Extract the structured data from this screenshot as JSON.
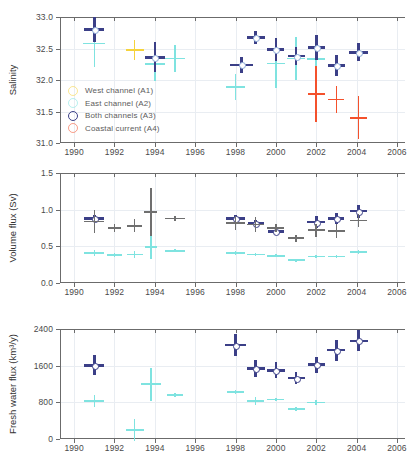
{
  "figure": {
    "width": 420,
    "height": 461,
    "background": "#ffffff"
  },
  "colors": {
    "west_channel": "#f5d33c",
    "east_channel": "#7fe3e0",
    "both_channels": "#3b3f87",
    "coastal_current": "#f4512c",
    "grey_series": "#6f6f6f",
    "axis": "#6b6b6b",
    "grid": "#e9edf2",
    "text": "#4a4a4a"
  },
  "legend": {
    "position": "top-panel-lower-left",
    "items": [
      {
        "label": "West channel (A1)",
        "color_key": "west_channel",
        "marker": "open-circle"
      },
      {
        "label": "East channel (A2)",
        "color_key": "east_channel",
        "marker": "open-circle"
      },
      {
        "label": "Both channels (A3)",
        "color_key": "both_channels",
        "marker": "open-circle"
      },
      {
        "label": "Coastal current (A4)",
        "color_key": "coastal_current",
        "marker": "open-circle"
      }
    ]
  },
  "xaxis": {
    "label": "",
    "min": 1989.3,
    "max": 2006.4,
    "ticks": [
      1990,
      1992,
      1994,
      1996,
      1998,
      2000,
      2002,
      2004,
      2006
    ],
    "ticklabels": [
      "1990",
      "1992",
      "1994",
      "1996",
      "1998",
      "2000",
      "2002",
      "2004",
      "2006"
    ],
    "grid": true
  },
  "chart_data": [
    {
      "type": "scatter",
      "panel": 1,
      "title": "",
      "xlabel": "",
      "ylabel": "Salinity",
      "ylim": [
        31.0,
        33.0
      ],
      "yticks": [
        31.0,
        31.5,
        32.0,
        32.5,
        33.0
      ],
      "yticklabels": [
        "31.0",
        "31.5",
        "32.0",
        "32.5",
        "33.0"
      ],
      "grid": true,
      "legend_position": "lower left",
      "series": [
        {
          "name": "West channel (A1)",
          "color_key": "west_channel",
          "marker": "cross-errorbar",
          "points": [
            {
              "x": 1993.0,
              "y": 32.48,
              "xerr": 0.45,
              "yerr": 0.16
            }
          ]
        },
        {
          "name": "East channel (A2)",
          "color_key": "east_channel",
          "marker": "cross-errorbar",
          "points": [
            {
              "x": 1991.0,
              "y": 32.58,
              "xerr": 0.55,
              "yerr": 0.37
            },
            {
              "x": 1994.0,
              "y": 32.25,
              "xerr": 0.5,
              "yerr": 0.26
            },
            {
              "x": 1995.0,
              "y": 32.34,
              "xerr": 0.5,
              "yerr": 0.21
            },
            {
              "x": 1998.0,
              "y": 31.89,
              "xerr": 0.45,
              "yerr": 0.21
            },
            {
              "x": 1999.0,
              "y": 32.67,
              "xerr": 0.45,
              "yerr": 0.1
            },
            {
              "x": 2000.0,
              "y": 32.26,
              "xerr": 0.45,
              "yerr": 0.38
            },
            {
              "x": 2001.0,
              "y": 32.34,
              "xerr": 0.45,
              "yerr": 0.34
            },
            {
              "x": 2002.0,
              "y": 32.33,
              "xerr": 0.45,
              "yerr": 0.34
            }
          ]
        },
        {
          "name": "Both channels (A3)",
          "color_key": "both_channels",
          "marker": "cross-errorbar-open-circle",
          "points": [
            {
              "x": 1991.0,
              "y": 32.8,
              "xerr": 0.5,
              "yerr": 0.2
            },
            {
              "x": 1994.0,
              "y": 32.36,
              "xerr": 0.5,
              "yerr": 0.24
            },
            {
              "x": 1998.3,
              "y": 32.24,
              "xerr": 0.55,
              "yerr": 0.13
            },
            {
              "x": 1999.0,
              "y": 32.67,
              "xerr": 0.45,
              "yerr": 0.1
            },
            {
              "x": 2000.0,
              "y": 32.48,
              "xerr": 0.42,
              "yerr": 0.18
            },
            {
              "x": 2001.0,
              "y": 32.38,
              "xerr": 0.42,
              "yerr": 0.14
            },
            {
              "x": 2002.0,
              "y": 32.52,
              "xerr": 0.42,
              "yerr": 0.2
            },
            {
              "x": 2003.0,
              "y": 32.23,
              "xerr": 0.42,
              "yerr": 0.17
            },
            {
              "x": 2004.1,
              "y": 32.44,
              "xerr": 0.48,
              "yerr": 0.14
            }
          ]
        },
        {
          "name": "Coastal current (A4)",
          "color_key": "coastal_current",
          "marker": "cross-errorbar",
          "points": [
            {
              "x": 2002.0,
              "y": 31.78,
              "xerr": 0.42,
              "yerr": 0.44
            },
            {
              "x": 2003.0,
              "y": 31.69,
              "xerr": 0.4,
              "yerr": 0.21
            },
            {
              "x": 2004.1,
              "y": 31.4,
              "xerr": 0.42,
              "yerr": 0.34
            }
          ]
        }
      ]
    },
    {
      "type": "scatter",
      "panel": 2,
      "title": "",
      "xlabel": "",
      "ylabel": "Volume flux (Sv)",
      "ylim": [
        0.0,
        1.5
      ],
      "yticks": [
        0.0,
        0.5,
        1.0,
        1.5
      ],
      "yticklabels": [
        "0.0",
        "0.5",
        "1.0",
        "1.5"
      ],
      "grid": true,
      "series": [
        {
          "name": "East channel (A2)",
          "color_key": "east_channel",
          "marker": "cross-errorbar",
          "points": [
            {
              "x": 1991.0,
              "y": 0.41,
              "xerr": 0.5,
              "yerr": 0.04
            },
            {
              "x": 1992.0,
              "y": 0.38,
              "xerr": 0.35,
              "yerr": 0.03
            },
            {
              "x": 1993.0,
              "y": 0.39,
              "xerr": 0.4,
              "yerr": 0.05
            },
            {
              "x": 1993.8,
              "y": 0.49,
              "xerr": 0.3,
              "yerr": 0.16
            },
            {
              "x": 1995.0,
              "y": 0.44,
              "xerr": 0.5,
              "yerr": 0.02
            },
            {
              "x": 1998.0,
              "y": 0.41,
              "xerr": 0.45,
              "yerr": 0.03
            },
            {
              "x": 1999.0,
              "y": 0.39,
              "xerr": 0.45,
              "yerr": 0.02
            },
            {
              "x": 2000.0,
              "y": 0.37,
              "xerr": 0.45,
              "yerr": 0.02
            },
            {
              "x": 2001.0,
              "y": 0.31,
              "xerr": 0.42,
              "yerr": 0.02
            },
            {
              "x": 2002.0,
              "y": 0.36,
              "xerr": 0.42,
              "yerr": 0.02
            },
            {
              "x": 2003.0,
              "y": 0.36,
              "xerr": 0.42,
              "yerr": 0.02
            },
            {
              "x": 2004.1,
              "y": 0.42,
              "xerr": 0.42,
              "yerr": 0.03
            }
          ]
        },
        {
          "name": "Both channels (A3)",
          "color_key": "both_channels",
          "marker": "cross-errorbar-open-circle",
          "points": [
            {
              "x": 1991.0,
              "y": 0.88,
              "xerr": 0.5,
              "yerr": 0.05
            },
            {
              "x": 1998.0,
              "y": 0.88,
              "xerr": 0.45,
              "yerr": 0.05
            },
            {
              "x": 1999.0,
              "y": 0.81,
              "xerr": 0.4,
              "yerr": 0.05
            },
            {
              "x": 2000.0,
              "y": 0.7,
              "xerr": 0.4,
              "yerr": 0.05
            },
            {
              "x": 2002.0,
              "y": 0.83,
              "xerr": 0.45,
              "yerr": 0.08
            },
            {
              "x": 2003.0,
              "y": 0.88,
              "xerr": 0.4,
              "yerr": 0.08
            },
            {
              "x": 2004.1,
              "y": 0.98,
              "xerr": 0.42,
              "yerr": 0.09
            }
          ]
        },
        {
          "name": "Combined estimate",
          "color_key": "grey_series",
          "marker": "cross-errorbar",
          "points": [
            {
              "x": 1991.0,
              "y": 0.84,
              "xerr": 0.5,
              "yerr": 0.16
            },
            {
              "x": 1992.0,
              "y": 0.75,
              "xerr": 0.3,
              "yerr": 0.06
            },
            {
              "x": 1993.0,
              "y": 0.78,
              "xerr": 0.38,
              "yerr": 0.09
            },
            {
              "x": 1993.8,
              "y": 0.97,
              "xerr": 0.33,
              "yerr": 0.33
            },
            {
              "x": 1995.0,
              "y": 0.88,
              "xerr": 0.5,
              "yerr": 0.03
            },
            {
              "x": 1998.0,
              "y": 0.82,
              "xerr": 0.45,
              "yerr": 0.1
            },
            {
              "x": 1999.0,
              "y": 0.8,
              "xerr": 0.42,
              "yerr": 0.1
            },
            {
              "x": 2000.0,
              "y": 0.75,
              "xerr": 0.42,
              "yerr": 0.06
            },
            {
              "x": 2001.0,
              "y": 0.61,
              "xerr": 0.4,
              "yerr": 0.05
            },
            {
              "x": 2002.0,
              "y": 0.72,
              "xerr": 0.42,
              "yerr": 0.09
            },
            {
              "x": 2003.0,
              "y": 0.71,
              "xerr": 0.42,
              "yerr": 0.09
            },
            {
              "x": 2004.1,
              "y": 0.85,
              "xerr": 0.42,
              "yerr": 0.09
            }
          ]
        }
      ]
    },
    {
      "type": "scatter",
      "panel": 3,
      "title": "",
      "xlabel": "",
      "ylabel": "Fresh water flux (km³/y)",
      "ylim": [
        0,
        2400
      ],
      "yticks": [
        0,
        800,
        1600,
        2400
      ],
      "yticklabels": [
        "0",
        "800",
        "1600",
        "2400"
      ],
      "grid": true,
      "series": [
        {
          "name": "East channel (A2)",
          "color_key": "east_channel",
          "marker": "cross-errorbar",
          "points": [
            {
              "x": 1991.0,
              "y": 830,
              "xerr": 0.5,
              "yerr": 140
            },
            {
              "x": 1993.0,
              "y": 190,
              "xerr": 0.45,
              "yerr": 240
            },
            {
              "x": 1993.8,
              "y": 1200,
              "xerr": 0.5,
              "yerr": 360
            },
            {
              "x": 1995.0,
              "y": 960,
              "xerr": 0.4,
              "yerr": 40
            },
            {
              "x": 1998.0,
              "y": 1030,
              "xerr": 0.4,
              "yerr": 40
            },
            {
              "x": 1999.0,
              "y": 830,
              "xerr": 0.42,
              "yerr": 90
            },
            {
              "x": 2000.0,
              "y": 860,
              "xerr": 0.42,
              "yerr": 40
            },
            {
              "x": 2001.0,
              "y": 660,
              "xerr": 0.42,
              "yerr": 40
            },
            {
              "x": 2002.0,
              "y": 800,
              "xerr": 0.45,
              "yerr": 60
            }
          ]
        },
        {
          "name": "Both channels (A3)",
          "color_key": "both_channels",
          "marker": "cross-errorbar-open-circle",
          "points": [
            {
              "x": 1991.0,
              "y": 1610,
              "xerr": 0.5,
              "yerr": 220
            },
            {
              "x": 1998.0,
              "y": 2050,
              "xerr": 0.5,
              "yerr": 250
            },
            {
              "x": 1999.0,
              "y": 1540,
              "xerr": 0.45,
              "yerr": 180
            },
            {
              "x": 2000.0,
              "y": 1500,
              "xerr": 0.45,
              "yerr": 170
            },
            {
              "x": 2001.0,
              "y": 1330,
              "xerr": 0.42,
              "yerr": 130
            },
            {
              "x": 2002.0,
              "y": 1620,
              "xerr": 0.42,
              "yerr": 170
            },
            {
              "x": 2003.0,
              "y": 1940,
              "xerr": 0.45,
              "yerr": 230
            },
            {
              "x": 2004.1,
              "y": 2140,
              "xerr": 0.45,
              "yerr": 230
            }
          ]
        }
      ]
    }
  ]
}
